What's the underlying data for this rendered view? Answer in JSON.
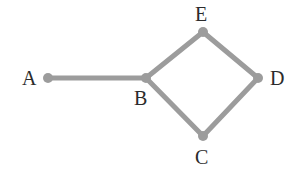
{
  "figure": {
    "name": "undirected-graph-diagram",
    "background_color": "#ffffff",
    "width": 298,
    "height": 182
  },
  "style": {
    "node_color": "#9c9c9c",
    "edge_color": "#9c9c9c",
    "label_color": "#2b2b2b",
    "node_radius": 5,
    "edge_width": 5
  },
  "chart_data": {
    "type": "graph",
    "title": "",
    "nodes": [
      {
        "id": "A",
        "label": "A",
        "x": 48,
        "y": 78,
        "label_x": 22,
        "label_y": 68
      },
      {
        "id": "B",
        "label": "B",
        "x": 146,
        "y": 78,
        "label_x": 134,
        "label_y": 88
      },
      {
        "id": "C",
        "label": "C",
        "x": 203,
        "y": 136,
        "label_x": 195,
        "label_y": 147
      },
      {
        "id": "D",
        "label": "D",
        "x": 258,
        "y": 78,
        "label_x": 270,
        "label_y": 68
      },
      {
        "id": "E",
        "label": "E",
        "x": 203,
        "y": 32,
        "label_x": 195,
        "label_y": 4
      }
    ],
    "edges": [
      {
        "source": "A",
        "target": "B"
      },
      {
        "source": "B",
        "target": "E"
      },
      {
        "source": "B",
        "target": "C"
      },
      {
        "source": "E",
        "target": "D"
      },
      {
        "source": "C",
        "target": "D"
      }
    ],
    "directed": false,
    "node_count": 5,
    "edge_count": 5
  }
}
